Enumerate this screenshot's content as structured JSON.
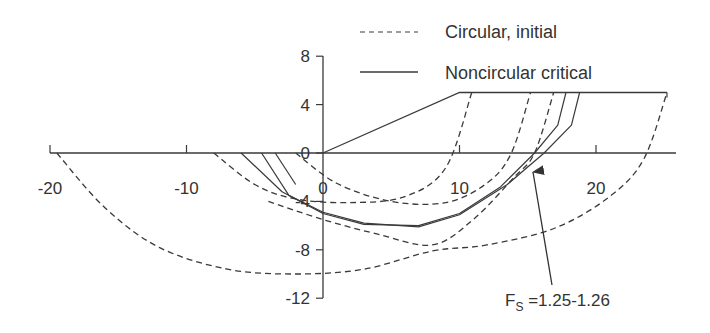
{
  "chart_data": {
    "type": "line",
    "title": "",
    "xlabel": "",
    "ylabel": "",
    "xlim": [
      -20,
      26
    ],
    "ylim": [
      -12,
      8
    ],
    "x_ticks": [
      -20,
      -10,
      0,
      10,
      20
    ],
    "x_tick_labels": [
      "-20",
      "-10",
      "0",
      "10",
      "20"
    ],
    "y_ticks": [
      8,
      4,
      0,
      -4,
      -8,
      -12
    ],
    "y_tick_labels": [
      "8",
      "4",
      "0",
      "-4",
      "-8",
      "-12"
    ],
    "grid": false,
    "legend_position": "top-right",
    "legend": [
      {
        "label": "Circular, initial",
        "style": "dashed"
      },
      {
        "label": "Noncircular critical",
        "style": "solid"
      }
    ],
    "slope_geometry": {
      "name": "Slope surface",
      "points": [
        [
          -20,
          0
        ],
        [
          0,
          0
        ],
        [
          10,
          5
        ],
        [
          25.2,
          5
        ]
      ]
    },
    "series": [
      {
        "name": "Circular, initial 1",
        "style": "dashed",
        "points": [
          [
            -19.5,
            0
          ],
          [
            -16,
            -4.5
          ],
          [
            -12,
            -7.8
          ],
          [
            -7,
            -9.6
          ],
          [
            -2,
            -10
          ],
          [
            3,
            -9.6
          ],
          [
            8,
            -8.1
          ],
          [
            12,
            -7.6
          ],
          [
            17,
            -6.2
          ],
          [
            21,
            -3.6
          ],
          [
            23.5,
            -0.5
          ],
          [
            25.2,
            5
          ]
        ]
      },
      {
        "name": "Circular, initial 2",
        "style": "dashed",
        "points": [
          [
            -8,
            0
          ],
          [
            -5,
            -2.6
          ],
          [
            -2,
            -3.8
          ],
          [
            2,
            -4.1
          ],
          [
            6,
            -3.6
          ],
          [
            9,
            -1.2
          ],
          [
            10.9,
            5
          ]
        ]
      },
      {
        "name": "Circular, initial 3",
        "style": "dashed",
        "points": [
          [
            -2,
            0
          ],
          [
            1,
            -2.5
          ],
          [
            5,
            -4
          ],
          [
            9,
            -4.1
          ],
          [
            12,
            -2.5
          ],
          [
            13.8,
            0
          ],
          [
            15.2,
            5
          ]
        ]
      },
      {
        "name": "Circular, initial 4",
        "style": "dashed",
        "points": [
          [
            -4,
            -4
          ],
          [
            0,
            -5.5
          ],
          [
            4,
            -6.7
          ],
          [
            8,
            -7.6
          ],
          [
            11,
            -5.5
          ],
          [
            14,
            -2
          ],
          [
            15.5,
            0
          ],
          [
            16.9,
            5
          ]
        ]
      },
      {
        "name": "Noncircular critical 1",
        "style": "solid",
        "points": [
          [
            -6,
            0
          ],
          [
            -3,
            -3.2
          ],
          [
            0,
            -5
          ],
          [
            3,
            -5.9
          ],
          [
            7,
            -6
          ],
          [
            10,
            -5
          ],
          [
            13,
            -2.8
          ],
          [
            15.5,
            0
          ],
          [
            17.2,
            2.3
          ],
          [
            17.8,
            5
          ]
        ]
      },
      {
        "name": "Noncircular critical 2",
        "style": "solid",
        "points": [
          [
            -4.5,
            0
          ],
          [
            -2.5,
            -3.5
          ],
          [
            0,
            -4.9
          ],
          [
            3,
            -5.8
          ],
          [
            7,
            -6.1
          ],
          [
            10,
            -5.1
          ],
          [
            13.5,
            -2.6
          ],
          [
            16.2,
            0
          ],
          [
            18.2,
            2.3
          ],
          [
            18.8,
            5
          ]
        ]
      },
      {
        "name": "Noncircular critical 3",
        "style": "solid",
        "points": [
          [
            -3.5,
            0
          ],
          [
            -2,
            -2.6
          ]
        ]
      }
    ],
    "annotations": [
      {
        "text_main": "F",
        "text_sub": "S",
        "text_rest": " =1.25-1.26",
        "arrow_from": [
          16.8,
          -10.9
        ],
        "arrow_to": [
          15.5,
          -1.5
        ]
      }
    ]
  },
  "legend": {
    "item0": "Circular, initial",
    "item1": "Noncircular critical"
  },
  "annotation": {
    "main": "F",
    "sub": "S",
    "rest": " =1.25-1.26"
  },
  "axis": {
    "x_labels": [
      "-20",
      "-10",
      "0",
      "10",
      "20"
    ],
    "y_labels": [
      "8",
      "4",
      "0",
      "-4",
      "-8",
      "-12"
    ]
  },
  "colors": {
    "line": "#3a3a3a",
    "text": "#333333",
    "background": "#ffffff"
  }
}
